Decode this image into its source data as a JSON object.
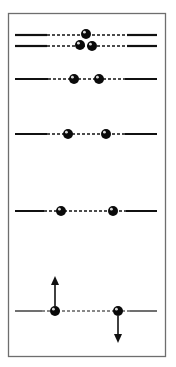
{
  "diagram": {
    "frame": {
      "x": 8,
      "y": 13,
      "width": 157,
      "height": 343,
      "stroke": "#6e6e6e"
    },
    "colors": {
      "line": "#111111",
      "ball": "#0a0a0a",
      "ball_highlight": "#ffffff"
    },
    "rows": [
      {
        "y": 35,
        "solid_left": [
          15,
          47
        ],
        "dash": [
          47,
          127
        ],
        "solid_right": [
          127,
          157
        ],
        "line_width": 2.2,
        "balls": [
          {
            "x": 86,
            "y": 34
          }
        ]
      },
      {
        "y": 46,
        "solid_left": [
          15,
          47
        ],
        "dash": [
          47,
          127
        ],
        "solid_right": [
          127,
          157
        ],
        "line_width": 2.2,
        "balls": [
          {
            "x": 80,
            "y": 45
          },
          {
            "x": 92,
            "y": 46
          }
        ]
      },
      {
        "y": 79,
        "solid_left": [
          15,
          48
        ],
        "dash": [
          48,
          125
        ],
        "solid_right": [
          125,
          157
        ],
        "line_width": 2,
        "balls": [
          {
            "x": 74,
            "y": 79
          },
          {
            "x": 99,
            "y": 79
          }
        ]
      },
      {
        "y": 134,
        "solid_left": [
          15,
          47
        ],
        "dash": [
          47,
          125
        ],
        "solid_right": [
          125,
          157
        ],
        "line_width": 2,
        "balls": [
          {
            "x": 68,
            "y": 134
          },
          {
            "x": 106,
            "y": 134
          }
        ]
      },
      {
        "y": 211,
        "solid_left": [
          15,
          44
        ],
        "dash": [
          44,
          126
        ],
        "solid_right": [
          126,
          157
        ],
        "line_width": 2,
        "balls": [
          {
            "x": 61,
            "y": 211
          },
          {
            "x": 113,
            "y": 211
          }
        ]
      },
      {
        "y": 311,
        "solid_left": [
          15,
          42
        ],
        "dash": [
          42,
          130
        ],
        "solid_right": [
          130,
          157
        ],
        "line_width": 1.2,
        "balls": [
          {
            "x": 55,
            "y": 311
          },
          {
            "x": 118,
            "y": 311
          }
        ]
      }
    ],
    "arrows": [
      {
        "direction": "up",
        "x": 55,
        "from_y": 306,
        "to_y": 276
      },
      {
        "direction": "down",
        "x": 118,
        "from_y": 316,
        "to_y": 343
      }
    ],
    "ball_radius": 5
  }
}
